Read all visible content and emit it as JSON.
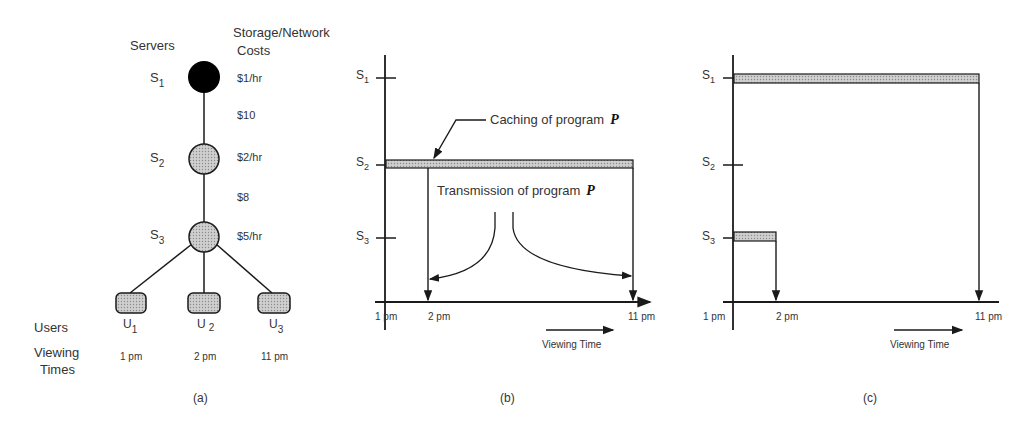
{
  "panel_a": {
    "header_servers": "Servers",
    "header_costs_1": "Storage/Network",
    "header_costs_2": "Costs",
    "servers": [
      {
        "name": "S",
        "sub": "1",
        "storage_cost": "$1/hr"
      },
      {
        "name": "S",
        "sub": "2",
        "storage_cost": "$2/hr"
      },
      {
        "name": "S",
        "sub": "3",
        "storage_cost": "$5/hr"
      }
    ],
    "link_costs": [
      "$10",
      "$8"
    ],
    "users_label": "Users",
    "viewing_label_1": "Viewing",
    "viewing_label_2": "Times",
    "users": [
      {
        "name": "U",
        "sub": "1",
        "time": "1 pm"
      },
      {
        "name": "U",
        "sub": "2",
        "time": "2 pm"
      },
      {
        "name": "U",
        "sub": "3",
        "time": "11 pm"
      }
    ],
    "caption": "(a)"
  },
  "panel_b": {
    "y_ticks": [
      {
        "name": "S",
        "sub": "1"
      },
      {
        "name": "S",
        "sub": "2"
      },
      {
        "name": "S",
        "sub": "3"
      }
    ],
    "x_ticks": [
      "1 pm",
      "2 pm",
      "11 pm"
    ],
    "caching_label": "Caching of program",
    "transmission_label": "Transmission of program",
    "program": "P",
    "x_axis_label": "Viewing Time",
    "caption": "(b)"
  },
  "panel_c": {
    "y_ticks": [
      {
        "name": "S",
        "sub": "1"
      },
      {
        "name": "S",
        "sub": "2"
      },
      {
        "name": "S",
        "sub": "3"
      }
    ],
    "x_ticks": [
      "1 pm",
      "2 pm",
      "11 pm"
    ],
    "x_axis_label": "Viewing Time",
    "caption": "(c)"
  },
  "colors": {
    "ink": "#1a1a1a",
    "fill_gray": "#bdbdbd",
    "text": "#333333"
  }
}
